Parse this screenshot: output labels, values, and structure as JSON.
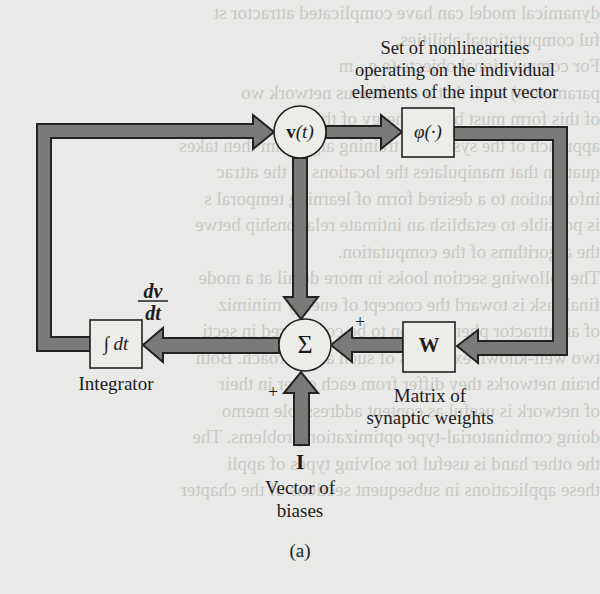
{
  "figure": {
    "caption": "(a)",
    "nodes": {
      "state": {
        "label_bold": "v",
        "label_rest": "(t)"
      },
      "nonlinearity": {
        "label": "φ(·)"
      },
      "sum": {
        "label": "Σ"
      },
      "weights": {
        "label": "W"
      },
      "integrator": {
        "label": "∫ dt"
      },
      "bias": {
        "label": "I"
      }
    },
    "annotations": {
      "nonlinearity_desc": [
        "Set of nonlinearities",
        "operating on the individual",
        "elements of the input vector"
      ],
      "integrator_desc": "Integrator",
      "weights_desc": [
        "Matrix of",
        "synaptic weights"
      ],
      "bias_desc": [
        "Vector of",
        "biases"
      ],
      "derivative_num": "dv",
      "derivative_den": "dt",
      "plus_weights": "+",
      "plus_bias": "+"
    },
    "edges": [
      {
        "from": "integrator",
        "to": "state",
        "path": "left loop, top"
      },
      {
        "from": "state",
        "to": "nonlinearity"
      },
      {
        "from": "nonlinearity",
        "to": "weights",
        "path": "right loop"
      },
      {
        "from": "weights",
        "to": "sum",
        "sign": "+"
      },
      {
        "from": "bias",
        "to": "sum",
        "sign": "+"
      },
      {
        "from": "state",
        "to": "sum",
        "sign": "−"
      },
      {
        "from": "sum",
        "to": "integrator",
        "label": "dv/dt"
      }
    ]
  },
  "background_text": [
    "dynamical model can have complicated attractor st",
    "ful computational abilities.",
    "For computational objects (e.g., m",
    "parameters) such that a continuous network wo",
    "of this form must be the energy of the sys",
    "approach of the system. A training algorithm then takes",
    "quation that manipulates the locations of the attrac",
    "information to a desired form of learning temporal s",
    "is possible to establish an intimate relationship betwe",
    "the algorithms of the computation.",
    "The following section looks in more detail at a mode",
    "final task is toward the concept of energy minimiz",
    "of an attractor phenomenon to be considered in secti",
    "two well-known examples of such an approach. Both",
    "brain networks they differ from each other in their",
    "of network is useful as content addressable memo",
    "doing combinatorial-type optimization problems. The",
    "the other hand is useful for solving types of appli",
    "these applications in subsequent sections of the chapter"
  ]
}
